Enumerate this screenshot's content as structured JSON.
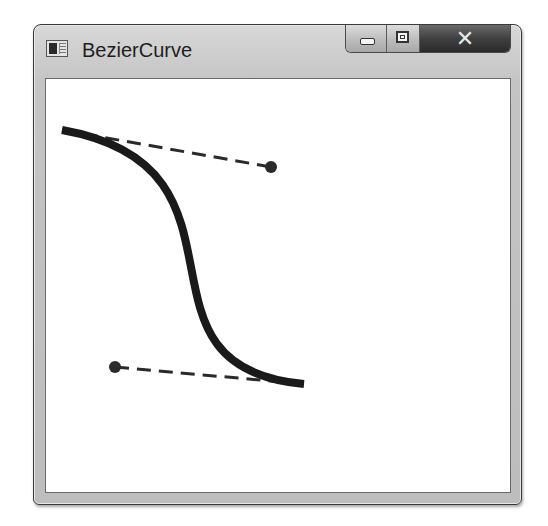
{
  "window": {
    "title": "BezierCurve",
    "icon": "app-window-icon",
    "caption_buttons": [
      {
        "name": "minimize",
        "icon": "minimize-icon"
      },
      {
        "name": "maximize",
        "icon": "maximize-icon"
      },
      {
        "name": "close",
        "icon": "close-icon",
        "glyph": "✕"
      }
    ]
  },
  "canvas": {
    "curve": {
      "type": "cubic-bezier",
      "start": [
        62,
        130
      ],
      "control1": [
        271,
        167
      ],
      "control2": [
        115,
        367
      ],
      "end": [
        304,
        384
      ],
      "stroke_color": "#1a1a1a",
      "stroke_width": 8
    },
    "tangent_lines": {
      "style": "dashed",
      "color": "#2a2a2a",
      "width": 3
    },
    "control_point_color": "#2a2a2a",
    "control_point_radius": 6
  }
}
